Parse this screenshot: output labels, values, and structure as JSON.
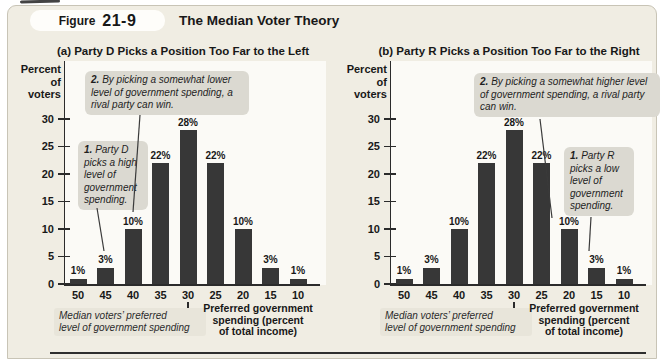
{
  "header": {
    "figure_label": "Figure",
    "figure_number": "21-9",
    "title": "The Median Voter Theory"
  },
  "chart_data": [
    {
      "type": "bar",
      "panel": "a",
      "title": "(a) Party D Picks a Position Too Far to the Left",
      "ylabel_lines": [
        "Percent",
        "of",
        "voters"
      ],
      "y_ticks": [
        30,
        25,
        20,
        15,
        10,
        5,
        0
      ],
      "ylim": [
        0,
        32
      ],
      "grid": false,
      "categories": [
        "50",
        "45",
        "40",
        "35",
        "30",
        "25",
        "20",
        "15",
        "10"
      ],
      "values": [
        1,
        3,
        10,
        22,
        28,
        22,
        10,
        3,
        1
      ],
      "bar_labels": [
        "1%",
        "3%",
        "10%",
        "22%",
        "28%",
        "22%",
        "10%",
        "3%",
        "1%"
      ],
      "bar_color": "#373737",
      "xlabel_lines": [
        "Preferred government",
        "spending (percent",
        "of total income)"
      ],
      "median_note_lines": [
        "Median voters’ preferred",
        "level of government spending"
      ],
      "annotations": [
        {
          "num": "1.",
          "text": "Party D picks a high level of government spending.",
          "points_to_category": "45"
        },
        {
          "num": "2.",
          "text": "By picking a somewhat lower level of government spending, a rival party can win.",
          "points_to_category": "40"
        }
      ]
    },
    {
      "type": "bar",
      "panel": "b",
      "title": "(b) Party R Picks a Position Too Far to the Right",
      "ylabel_lines": [
        "Percent",
        "of",
        "voters"
      ],
      "y_ticks": [
        30,
        25,
        20,
        15,
        10,
        5,
        0
      ],
      "ylim": [
        0,
        32
      ],
      "grid": false,
      "categories": [
        "50",
        "45",
        "40",
        "35",
        "30",
        "25",
        "20",
        "15",
        "10"
      ],
      "values": [
        1,
        3,
        10,
        22,
        28,
        22,
        10,
        3,
        1
      ],
      "bar_labels": [
        "1%",
        "3%",
        "10%",
        "22%",
        "28%",
        "22%",
        "10%",
        "3%",
        "1%"
      ],
      "bar_color": "#373737",
      "xlabel_lines": [
        "Preferred government",
        "spending (percent",
        "of total income)"
      ],
      "median_note_lines": [
        "Median voters’ preferred",
        "level of government spending"
      ],
      "annotations": [
        {
          "num": "1.",
          "text": "Party R picks a low level of government spending.",
          "points_to_category": "15"
        },
        {
          "num": "2.",
          "text": "By picking a somewhat higher level of government spending, a rival party can win.",
          "points_to_category": "20"
        }
      ]
    }
  ]
}
